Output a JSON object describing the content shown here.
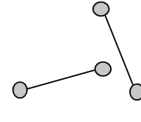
{
  "diagram": {
    "background": "#ffffff",
    "node_fill": "#c8c8c8",
    "stroke": "#1a1a1a",
    "nodes": [
      {
        "id": "a",
        "cx": 101,
        "cy": 9,
        "rx": 8,
        "ry": 7
      },
      {
        "id": "b",
        "cx": 103,
        "cy": 69,
        "rx": 8,
        "ry": 7
      },
      {
        "id": "c",
        "cx": 20,
        "cy": 90,
        "rx": 7,
        "ry": 8
      },
      {
        "id": "d",
        "cx": 137,
        "cy": 92,
        "rx": 7,
        "ry": 8
      }
    ],
    "edges": [
      {
        "from": "a",
        "to": "d",
        "x1": 105,
        "y1": 15,
        "x2": 133,
        "y2": 85
      },
      {
        "from": "c",
        "to": "b",
        "x1": 27,
        "y1": 89,
        "x2": 95,
        "y2": 70
      }
    ]
  }
}
